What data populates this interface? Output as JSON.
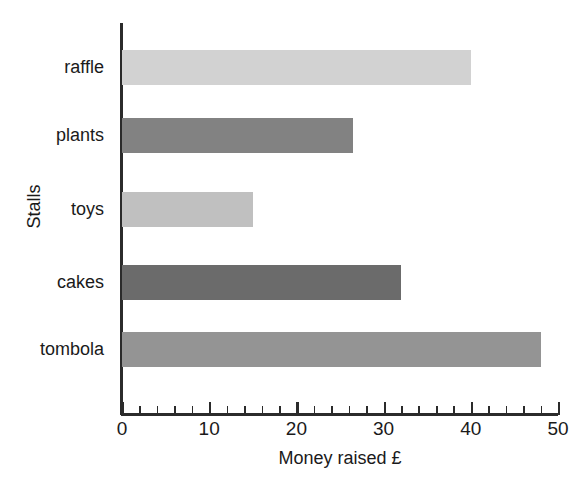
{
  "chart_data": {
    "type": "bar",
    "orientation": "horizontal",
    "title": "",
    "xlabel": "Money raised £",
    "ylabel": "Stalls",
    "categories": [
      "raffle",
      "plants",
      "toys",
      "cakes",
      "tombola"
    ],
    "values": [
      40,
      26.5,
      15,
      32,
      48
    ],
    "series": [
      {
        "name": "Money raised",
        "values": [
          40,
          26.5,
          15,
          32,
          48
        ]
      }
    ],
    "bar_colors": [
      "#d2d2d2",
      "#828282",
      "#c0c0c0",
      "#6b6b6b",
      "#949494"
    ],
    "xlim": [
      0,
      50
    ],
    "xticks": [
      0,
      10,
      20,
      30,
      40,
      50
    ],
    "xtick_labels": [
      "0",
      "10",
      "20",
      "30",
      "40",
      "50"
    ],
    "x_minor_tick_step": 2,
    "grid": false,
    "legend": false,
    "legend_position": "none",
    "axis_color": "#2b2b2b",
    "background_color": "#ffffff"
  },
  "axes": {
    "x_title": "Money raised £",
    "y_title": "Stalls"
  },
  "bars": [
    {
      "label": "raffle",
      "value": 40,
      "color": "#d2d2d2"
    },
    {
      "label": "plants",
      "value": 26.5,
      "color": "#828282"
    },
    {
      "label": "toys",
      "value": 15,
      "color": "#c0c0c0"
    },
    {
      "label": "cakes",
      "value": 32,
      "color": "#6b6b6b"
    },
    {
      "label": "tombola",
      "value": 48,
      "color": "#949494"
    }
  ],
  "xticks": [
    {
      "value": 0,
      "label": "0"
    },
    {
      "value": 10,
      "label": "10"
    },
    {
      "value": 20,
      "label": "20"
    },
    {
      "value": 30,
      "label": "30"
    },
    {
      "value": 40,
      "label": "40"
    },
    {
      "value": 50,
      "label": "50"
    }
  ]
}
